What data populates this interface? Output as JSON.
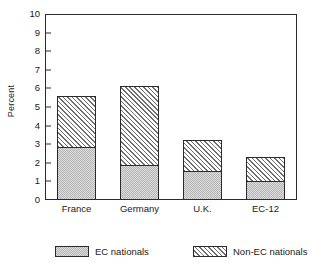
{
  "chart_data": {
    "type": "bar",
    "subtype": "stacked-bar",
    "title": "",
    "xlabel": "",
    "ylabel": "Percent",
    "ylim": [
      0,
      10
    ],
    "ytick_step": 1,
    "ytick_labels": [
      "10",
      "9",
      "8",
      "7",
      "6",
      "5",
      "4",
      "3",
      "2",
      "1",
      "0"
    ],
    "categories": [
      "France",
      "Germany",
      "U.K.",
      "EC-12"
    ],
    "grid": false,
    "legend_position": "bottom",
    "series": [
      {
        "name": "EC nationals",
        "fill": "solid-gray",
        "values": [
          2.8,
          1.85,
          1.5,
          0.95
        ]
      },
      {
        "name": "Non-EC nationals",
        "fill": "diagonal-hatch",
        "values": [
          2.75,
          4.2,
          1.7,
          1.3
        ]
      }
    ],
    "totals": [
      5.55,
      6.05,
      3.2,
      2.25
    ],
    "colors": {
      "axis": "#2b2b2b",
      "ec_nationals": "#b4b4b4",
      "non_ec_nationals": "#6f6f6f",
      "background": "#ffffff"
    }
  },
  "legend": {
    "entries": [
      {
        "label": "EC nationals"
      },
      {
        "label": "Non-EC nationals"
      }
    ]
  }
}
